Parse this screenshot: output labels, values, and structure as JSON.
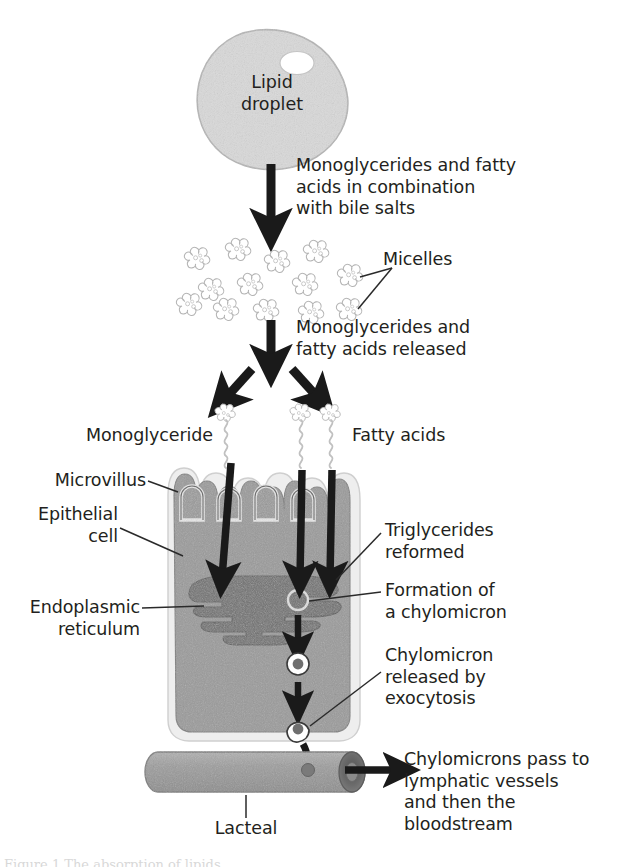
{
  "figure": {
    "bottom_caption": "Figure 1 The absorption of lipids"
  },
  "colors": {
    "ink": "#231f20",
    "cell_fill": "#9a9a9a",
    "cell_membrane": "#e8e8e8",
    "organelle": "#6f6f6f",
    "droplet_fill": "#d9d9d9",
    "droplet_edge": "#a8a8a8",
    "micelle": "#c9c9c9",
    "lacteal_fill": "#9a9a9a",
    "lacteal_end": "#6f6f6f",
    "background": "#ffffff"
  },
  "labels": {
    "lipid_droplet": "Lipid\ndroplet",
    "step_bile_salts": "Monoglycerides and fatty\nacids in combination\nwith bile salts",
    "micelles": "Micelles",
    "step_released": "Monoglycerides and\nfatty acids released",
    "monoglyceride": "Monoglyceride",
    "fatty_acids": "Fatty acids",
    "microvillus": "Microvillus",
    "epithelial_cell": "Epithelial\ncell",
    "endoplasmic_reticulum": "Endoplasmic\nreticulum",
    "triglycerides_reformed": "Triglycerides\nreformed",
    "formation_chylomicron": "Formation of\na chylomicron",
    "chylomicron_released": "Chylomicron\nreleased by\nexocytosis",
    "lacteal": "Lacteal",
    "chylomicrons_pass": "Chylomicrons pass to\nlymphatic vessels\nand then the\nbloodstream"
  },
  "structures": {
    "micelle_count": 13,
    "microvilli_count": 4,
    "molecule_count": 3,
    "vesicle_count": 2,
    "arrow_count": 9
  }
}
